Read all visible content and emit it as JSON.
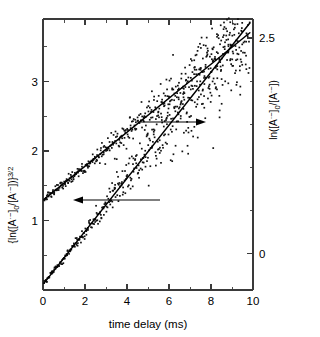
{
  "chart_data": {
    "type": "scatter",
    "title": "",
    "subtitle": "",
    "xlabel": "time delay (ms)",
    "ylabel_left": "{ln([A·⁻]₀/[A·⁻])}3/2",
    "ylabel_right": "ln([A·⁻]₀/[A·⁻])",
    "xlim": [
      0,
      10
    ],
    "ylim_left": [
      0,
      3.9
    ],
    "ylim_right": [
      -0.42,
      2.72
    ],
    "x_ticks_major": [
      0,
      2,
      4,
      6,
      8,
      10
    ],
    "x_tick_labels": [
      "0",
      "2",
      "4",
      "6",
      "8",
      "10"
    ],
    "x_ticks_minor": [
      1,
      3,
      5,
      7,
      9
    ],
    "y_left_ticks_major": [
      1,
      2,
      3
    ],
    "y_left_tick_labels": [
      "1",
      "2",
      "3"
    ],
    "y_left_ticks_minor": [
      0.5,
      1.5,
      2.5,
      3.5
    ],
    "y_right_ticks_major": [
      0,
      2.5
    ],
    "y_right_tick_labels": [
      "0",
      "2.5"
    ],
    "y_right_ticks_minor": [
      0.5,
      1.0,
      1.5,
      2.0
    ],
    "grid": false,
    "legend_position": "none",
    "series": [
      {
        "name": "ln([A·⁻]₀/[A·⁻]) (right axis)",
        "axis": "right",
        "marker": "dot",
        "color": "#111111",
        "fit_type": "linear",
        "fit_intercept": 0.62,
        "fit_slope": 0.197,
        "noise_scale_start": 0.02,
        "noise_scale_end": 0.3,
        "n_points": 430,
        "x_range": [
          0.05,
          9.85
        ]
      },
      {
        "name": "{ln([A·⁻]₀/[A·⁻])}3/2 (left axis)",
        "axis": "left",
        "marker": "dot",
        "color": "#111111",
        "fit_type": "linear",
        "fit_intercept": 0.08,
        "fit_slope": 0.382,
        "noise_scale_start": 0.015,
        "noise_scale_end": 0.52,
        "n_points": 430,
        "x_range": [
          0.05,
          9.85
        ]
      }
    ],
    "annotations": [
      {
        "name": "upper-arrow",
        "direction": "right",
        "x_start": 4.6,
        "x_end": 7.7,
        "y_right_axis": 1.44,
        "meaning": "upper dataset uses right axis"
      },
      {
        "name": "lower-arrow",
        "direction": "left",
        "x_start": 5.5,
        "x_end": 1.4,
        "y_right_axis": 0.18,
        "meaning": "lower dataset uses left axis"
      }
    ]
  },
  "labels": {
    "x_axis_title": "time delay (ms)",
    "y_left_base": "{ln([A",
    "y_left_mid": "]",
    "y_left_exp": "3/2",
    "y_right_title": "ln([A",
    "tick_0": "0",
    "tick_2": "2",
    "tick_4": "4",
    "tick_6": "6",
    "tick_8": "8",
    "tick_10": "10",
    "tick_left_1": "1",
    "tick_left_2": "2",
    "tick_left_3": "3",
    "tick_right_0": "0",
    "tick_right_25": "2.5"
  }
}
